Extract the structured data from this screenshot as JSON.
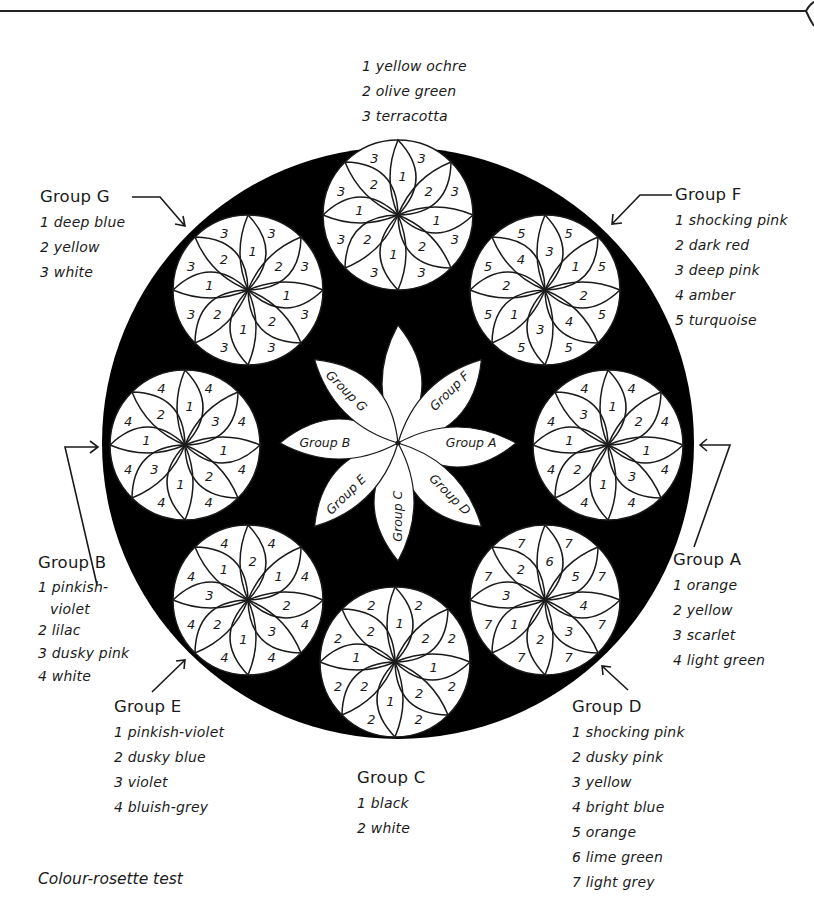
{
  "caption": "Colour-rosette test",
  "colors": {
    "background": "#ffffff",
    "ink": "#1a1a1a",
    "disc": "#000000",
    "rosette_fill": "#ffffff"
  },
  "top_key": {
    "items": [
      "1 yellow ochre",
      "2 olive green",
      "3 terracotta"
    ]
  },
  "groups": {
    "A": {
      "title": "Group A",
      "items": [
        "1 orange",
        "2 yellow",
        "3 scarlet",
        "4 light green"
      ]
    },
    "B": {
      "title": "Group B",
      "items": [
        "1 pinkish-",
        "violet",
        "2 lilac",
        "3 dusky pink",
        "4 white"
      ]
    },
    "C": {
      "title": "Group C",
      "items": [
        "1 black",
        "2 white"
      ]
    },
    "D": {
      "title": "Group D",
      "items": [
        "1 shocking pink",
        "2 dusky pink",
        "3 yellow",
        "4 bright blue",
        "5 orange",
        "6 lime green",
        "7 light grey"
      ]
    },
    "E": {
      "title": "Group E",
      "items": [
        "1 pinkish-violet",
        "2 dusky blue",
        "3 violet",
        "4 bluish-grey"
      ]
    },
    "F": {
      "title": "Group F",
      "items": [
        "1 shocking pink",
        "2 dark red",
        "3 deep pink",
        "4 amber",
        "5 turquoise"
      ]
    },
    "G": {
      "title": "Group G",
      "items": [
        "1 deep blue",
        "2 yellow",
        "3 white"
      ]
    }
  },
  "center_flower": {
    "petals": [
      "",
      "Group F",
      "Group A",
      "Group D",
      "Group C",
      "Group E",
      "Group B",
      "Group G"
    ]
  },
  "rosettes": [
    {
      "id": "top",
      "cx": 398,
      "cy": 215,
      "inner": [
        "1",
        "2",
        "1",
        "2",
        "1",
        "2",
        "1",
        "2"
      ],
      "outer": [
        "3",
        "3",
        "3",
        "3",
        "3",
        "3",
        "3",
        "3"
      ]
    },
    {
      "id": "G",
      "cx": 248,
      "cy": 290,
      "inner": [
        "1",
        "2",
        "1",
        "2",
        "1",
        "2",
        "1",
        "2"
      ],
      "outer": [
        "3",
        "3",
        "3",
        "3",
        "3",
        "3",
        "3",
        "3"
      ]
    },
    {
      "id": "F",
      "cx": 545,
      "cy": 290,
      "inner": [
        "3",
        "1",
        "2",
        "4",
        "3",
        "1",
        "2",
        "4"
      ],
      "outer": [
        "5",
        "5",
        "5",
        "5",
        "5",
        "5",
        "5",
        "5"
      ]
    },
    {
      "id": "B",
      "cx": 185,
      "cy": 445,
      "inner": [
        "1",
        "3",
        "1",
        "2",
        "1",
        "3",
        "1",
        "2"
      ],
      "outer": [
        "4",
        "4",
        "4",
        "4",
        "4",
        "4",
        "4",
        "4"
      ]
    },
    {
      "id": "A",
      "cx": 608,
      "cy": 445,
      "inner": [
        "1",
        "2",
        "1",
        "3",
        "1",
        "2",
        "1",
        "3"
      ],
      "outer": [
        "4",
        "4",
        "4",
        "4",
        "4",
        "4",
        "4",
        "4"
      ]
    },
    {
      "id": "E",
      "cx": 248,
      "cy": 600,
      "inner": [
        "2",
        "1",
        "2",
        "3",
        "1",
        "2",
        "3",
        "1"
      ],
      "outer": [
        "4",
        "4",
        "4",
        "4",
        "4",
        "4",
        "4",
        "4"
      ]
    },
    {
      "id": "C",
      "cx": 395,
      "cy": 662,
      "inner": [
        "1",
        "2",
        "1",
        "2",
        "1",
        "2",
        "1",
        "2"
      ],
      "outer": [
        "2",
        "2",
        "2",
        "2",
        "2",
        "2",
        "2",
        "2"
      ]
    },
    {
      "id": "D",
      "cx": 545,
      "cy": 600,
      "inner": [
        "6",
        "5",
        "4",
        "3",
        "2",
        "1",
        "3",
        "2"
      ],
      "outer": [
        "7",
        "7",
        "7",
        "7",
        "7",
        "7",
        "7",
        "7"
      ]
    }
  ]
}
